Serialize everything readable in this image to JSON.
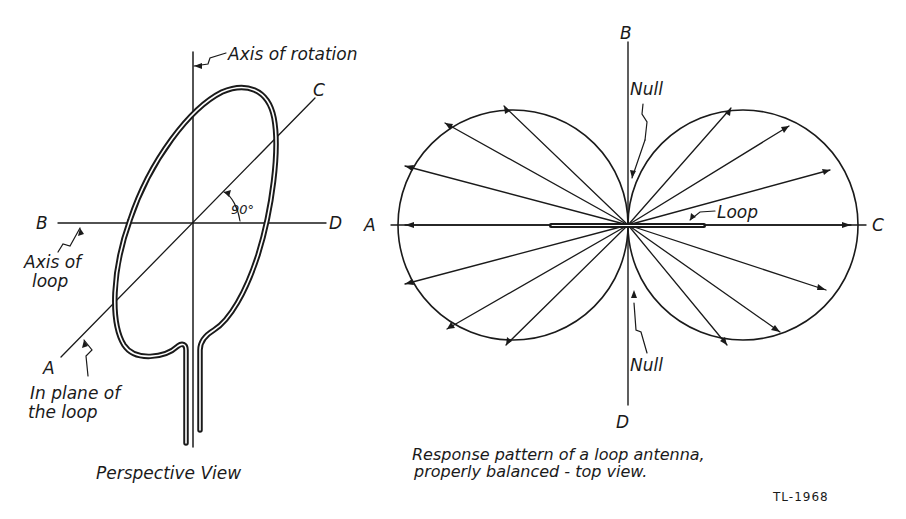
{
  "figure": {
    "left_panel": {
      "title": "Perspective View",
      "labels": {
        "axis_of_rotation": "Axis of rotation",
        "axis_of_loop_line1": "Axis of",
        "axis_of_loop_line2": "loop",
        "in_plane_line1": "In plane of",
        "in_plane_line2": "the loop",
        "angle": "90°",
        "point_a": "A",
        "point_b": "B",
        "point_c": "C",
        "point_d": "D"
      }
    },
    "right_panel": {
      "caption_line1": "Response pattern of a loop antenna,",
      "caption_line2": "properly balanced - top view.",
      "labels": {
        "point_a": "A",
        "point_b": "B",
        "point_c": "C",
        "point_d": "D",
        "null_top": "Null",
        "null_bottom": "Null",
        "loop": "Loop"
      },
      "pattern": "figure-eight (two circular lobes)",
      "lobes": 2,
      "null_directions": [
        "B",
        "D"
      ],
      "max_directions": [
        "A",
        "C"
      ]
    },
    "figure_id": "TL-1968"
  }
}
